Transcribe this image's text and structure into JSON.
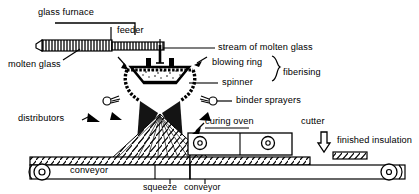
{
  "diagram": {
    "type": "process-flow-schematic",
    "style": "black-and-white line drawing with hatching",
    "labels": {
      "glass_furnace": "glass furnace",
      "feeder": "feeder",
      "molten_glass": "molten glass",
      "stream_of_molten_glass": "stream of molten glass",
      "blowing_ring": "blowing ring",
      "spinner": "spinner",
      "fiberising": "fiberising",
      "binder_sprayers": "binder sprayers",
      "distributors": "distributors",
      "curing_oven": "curing oven",
      "cutter": "cutter",
      "finished_insulation": "finished insulation",
      "conveyor": "conveyor",
      "squeeze": "squeeze",
      "squeeze_conveyor": "conveyor"
    },
    "components": [
      "glass furnace",
      "feeder",
      "spinner",
      "blowing ring",
      "binder sprayers",
      "distributors",
      "conveyor",
      "squeeze conveyor",
      "curing oven",
      "cutter",
      "finished insulation"
    ],
    "groupings": [
      {
        "brace_label": "fiberising",
        "members": [
          "blowing ring",
          "spinner"
        ]
      }
    ],
    "colors": {
      "ink": "#000000",
      "background": "#ffffff"
    }
  }
}
